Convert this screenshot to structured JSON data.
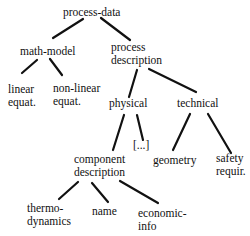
{
  "diagram": {
    "type": "tree",
    "nodes": {
      "root": {
        "id": "process-data",
        "lines": [
          "process-data"
        ]
      },
      "math_model": {
        "id": "math-model",
        "lines": [
          "math-model"
        ]
      },
      "process_description": {
        "id": "process-description",
        "lines": [
          "process",
          "description"
        ]
      },
      "linear": {
        "id": "linear-equat",
        "lines": [
          "linear",
          "equat."
        ]
      },
      "nonlinear": {
        "id": "non-linear-equat",
        "lines": [
          "non-linear",
          "equat."
        ]
      },
      "physical": {
        "id": "physical",
        "lines": [
          "physical"
        ]
      },
      "technical": {
        "id": "technical",
        "lines": [
          "technical"
        ]
      },
      "ellipsis": {
        "id": "ellipsis",
        "lines": [
          "[...]"
        ]
      },
      "geometry": {
        "id": "geometry",
        "lines": [
          "geometry"
        ]
      },
      "safety": {
        "id": "safety-requir",
        "lines": [
          "safety",
          "requir."
        ]
      },
      "component": {
        "id": "component-description",
        "lines": [
          "component",
          "description"
        ]
      },
      "thermo": {
        "id": "thermo-dynamics",
        "lines": [
          "thermo-",
          "dynamics"
        ]
      },
      "name": {
        "id": "name",
        "lines": [
          "name"
        ]
      },
      "economic": {
        "id": "economic-info",
        "lines": [
          "economic-",
          "info"
        ]
      }
    },
    "edges": [
      [
        "process-data",
        "math-model"
      ],
      [
        "process-data",
        "process-description"
      ],
      [
        "math-model",
        "linear-equat"
      ],
      [
        "math-model",
        "non-linear-equat"
      ],
      [
        "process-description",
        "physical"
      ],
      [
        "process-description",
        "technical"
      ],
      [
        "physical",
        "component-description"
      ],
      [
        "physical",
        "ellipsis"
      ],
      [
        "technical",
        "geometry"
      ],
      [
        "technical",
        "safety-requir"
      ],
      [
        "component-description",
        "thermo-dynamics"
      ],
      [
        "component-description",
        "name"
      ],
      [
        "component-description",
        "economic-info"
      ]
    ],
    "colors": {
      "line": "#111111",
      "text": "#111111",
      "background": "#ffffff"
    }
  }
}
